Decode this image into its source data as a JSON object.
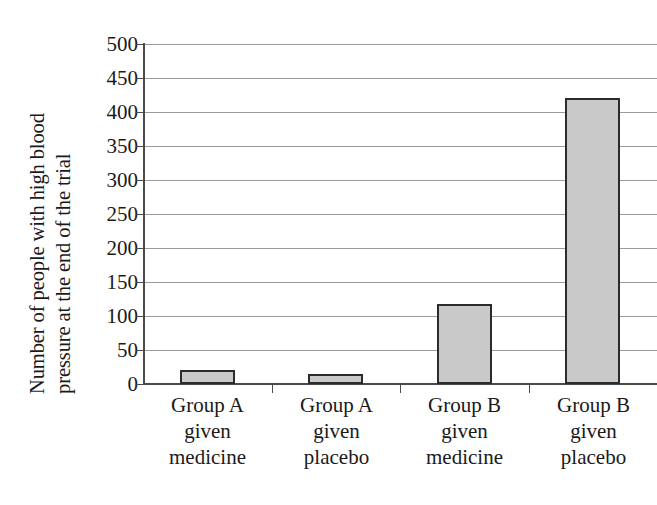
{
  "chart_data": {
    "type": "bar",
    "title": "",
    "subtitle": "",
    "xlabel": "",
    "ylabel_line1": "Number of people with high blood",
    "ylabel_line2": "pressure at the end of the trial",
    "categories": [
      "Group A given medicine",
      "Group A given placebo",
      "Group B given medicine",
      "Group B given placebo"
    ],
    "category_lines": [
      [
        "Group A",
        "given",
        "medicine"
      ],
      [
        "Group A",
        "given",
        "placebo"
      ],
      [
        "Group B",
        "given",
        "medicine"
      ],
      [
        "Group B",
        "given",
        "placebo"
      ]
    ],
    "values": [
      20,
      15,
      117,
      420
    ],
    "ylim": [
      0,
      500
    ],
    "ytick_step": 50,
    "ytick_labels": [
      "500",
      "450",
      "400",
      "350",
      "300",
      "250",
      "200",
      "150",
      "100",
      "50",
      "0"
    ],
    "ytick_values": [
      500,
      450,
      400,
      350,
      300,
      250,
      200,
      150,
      100,
      50,
      0
    ],
    "grid": true,
    "legend": false,
    "legend_position": "none",
    "bar_fill_color": "#c9c9c9",
    "bar_border_color": "#2b2b2b",
    "gridline_color": "#9a9a9a",
    "axis_color": "#4a4a4a",
    "text_color": "#1a1a1a",
    "background_color": "#ffffff"
  }
}
